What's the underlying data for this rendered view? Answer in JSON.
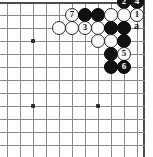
{
  "figure": {
    "kind": "go-board-diagram",
    "board_size_shown": "corner",
    "width_px": 153,
    "height_px": 157,
    "colors": {
      "background": "#ffffff",
      "grid_line": "#8a8a8a",
      "board_edge": "#4d4d4d",
      "black_stone": "#111111",
      "white_stone": "#fbfbfb",
      "stone_outline": "#2a2a2a",
      "star_point": "#2b2b2b"
    }
  },
  "grid": {
    "columns_x": [
      7,
      20,
      33,
      46,
      59,
      72,
      85,
      98,
      111,
      124,
      137
    ],
    "rows_y": [
      2,
      15,
      28,
      41,
      54,
      67,
      80,
      93,
      106,
      119,
      132,
      145
    ],
    "spacing_px": 13,
    "edges": {
      "top_y": 2,
      "right_x": 143
    }
  },
  "star_points": [
    {
      "col": 2,
      "row": 3
    },
    {
      "col": 2,
      "row": 8
    },
    {
      "col": 7,
      "row": 8
    }
  ],
  "stones": [
    {
      "col": 9,
      "row": 0,
      "color": "black",
      "label": "2"
    },
    {
      "col": 10,
      "row": 0,
      "color": "black",
      "label": "4"
    },
    {
      "col": 5,
      "row": 1,
      "color": "white",
      "label": "7"
    },
    {
      "col": 6,
      "row": 1,
      "color": "black",
      "label": ""
    },
    {
      "col": 7,
      "row": 1,
      "color": "black",
      "label": ""
    },
    {
      "col": 8,
      "row": 1,
      "color": "white",
      "label": ""
    },
    {
      "col": 9,
      "row": 1,
      "color": "white",
      "label": ""
    },
    {
      "col": 10,
      "row": 1,
      "color": "white",
      "label": "1"
    },
    {
      "col": 4,
      "row": 2,
      "color": "white",
      "label": ""
    },
    {
      "col": 5,
      "row": 2,
      "color": "white",
      "label": ""
    },
    {
      "col": 6,
      "row": 2,
      "color": "white",
      "label": "3"
    },
    {
      "col": 7,
      "row": 2,
      "color": "white",
      "label": ""
    },
    {
      "col": 8,
      "row": 2,
      "color": "black",
      "label": ""
    },
    {
      "col": 9,
      "row": 2,
      "color": "black",
      "label": ""
    },
    {
      "col": 7,
      "row": 3,
      "color": "white",
      "label": ""
    },
    {
      "col": 8,
      "row": 3,
      "color": "white",
      "label": ""
    },
    {
      "col": 9,
      "row": 3,
      "color": "black",
      "label": ""
    },
    {
      "col": 8,
      "row": 4,
      "color": "black",
      "label": ""
    },
    {
      "col": 9,
      "row": 4,
      "color": "white",
      "label": "5"
    },
    {
      "col": 8,
      "row": 5,
      "color": "black",
      "label": ""
    },
    {
      "col": 9,
      "row": 5,
      "color": "black",
      "label": "6"
    }
  ],
  "coordinate_markers": [
    {
      "text": "a",
      "col": 10,
      "row": 2
    }
  ],
  "move_sequence": [
    {
      "number": "1",
      "color": "white"
    },
    {
      "number": "2",
      "color": "black"
    },
    {
      "number": "3",
      "color": "white"
    },
    {
      "number": "4",
      "color": "black"
    },
    {
      "number": "5",
      "color": "white"
    },
    {
      "number": "6",
      "color": "black"
    },
    {
      "number": "7",
      "color": "white"
    }
  ]
}
